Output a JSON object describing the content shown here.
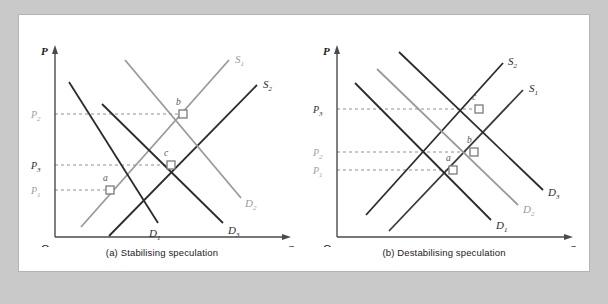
{
  "figure": {
    "background": "#ffffff",
    "outer_background": "#c9c9c9",
    "border_color": "#b4b4b4"
  },
  "colors": {
    "dark": "#2b2b2b",
    "gray": "#9a9a9a",
    "axis": "#4a4a4a",
    "dashed": "#8f8f8f",
    "point_fill": "#ffffff",
    "point_stroke": "#7a7a7a"
  },
  "panels": [
    {
      "id": "a",
      "caption": "(a)  Stabilising speculation",
      "axes": {
        "y_label": "P",
        "x_label": "Q",
        "origin_label": "O"
      },
      "price_levels": [
        {
          "label": "P",
          "sub": "2",
          "tone": "gray",
          "y": 99
        },
        {
          "label": "P",
          "sub": "3",
          "tone": "dark",
          "y": 150
        },
        {
          "label": "P",
          "sub": "1",
          "tone": "gray",
          "y": 175
        }
      ],
      "curves": [
        {
          "name": "S1",
          "label": "S",
          "sub": "1",
          "tone": "gray",
          "x1": 62,
          "y1": 212,
          "x2": 210,
          "y2": 45,
          "lx": 216,
          "ly": 48
        },
        {
          "name": "S2",
          "label": "S",
          "sub": "2",
          "tone": "dark",
          "x1": 90,
          "y1": 221,
          "x2": 238,
          "y2": 70,
          "lx": 244,
          "ly": 73
        },
        {
          "name": "D1",
          "label": "D",
          "sub": "1",
          "tone": "dark",
          "x1": 50,
          "y1": 67,
          "x2": 139,
          "y2": 208,
          "lx": 130,
          "ly": 218
        },
        {
          "name": "D2",
          "label": "D",
          "sub": "2",
          "tone": "gray",
          "x1": 106,
          "y1": 45,
          "x2": 222,
          "y2": 183,
          "lx": 225,
          "ly": 190
        },
        {
          "name": "D3",
          "label": "D",
          "sub": "3",
          "tone": "dark",
          "x1": 83,
          "y1": 89,
          "x2": 204,
          "y2": 208,
          "lx": 208,
          "ly": 216
        }
      ],
      "points": [
        {
          "label": "a",
          "x": 91,
          "y": 175,
          "lx": 86,
          "ly": 167
        },
        {
          "label": "b",
          "x": 164,
          "y": 99,
          "lx": 159,
          "ly": 91
        },
        {
          "label": "c",
          "x": 152,
          "y": 150,
          "lx": 147,
          "ly": 142
        }
      ]
    },
    {
      "id": "b",
      "caption": "(b)  Destabilising speculation",
      "axes": {
        "y_label": "P",
        "x_label": "Q",
        "origin_label": "O"
      },
      "price_levels": [
        {
          "label": "P",
          "sub": "3",
          "tone": "dark",
          "y": 94
        },
        {
          "label": "P",
          "sub": "2",
          "tone": "gray",
          "y": 137
        },
        {
          "label": "P",
          "sub": "1",
          "tone": "gray",
          "y": 155
        }
      ],
      "curves": [
        {
          "name": "S2",
          "label": "S",
          "sub": "2",
          "tone": "dark",
          "x1": 65,
          "y1": 200,
          "x2": 202,
          "y2": 48,
          "lx": 207,
          "ly": 50
        },
        {
          "name": "S1",
          "label": "S",
          "sub": "1",
          "tone": "dark",
          "x1": 88,
          "y1": 216,
          "x2": 222,
          "y2": 75,
          "lx": 227,
          "ly": 77
        },
        {
          "name": "D1",
          "label": "D",
          "sub": "1",
          "tone": "dark",
          "x1": 54,
          "y1": 68,
          "x2": 190,
          "y2": 205,
          "lx": 195,
          "ly": 212
        },
        {
          "name": "D2",
          "label": "D",
          "sub": "2",
          "tone": "gray",
          "x1": 76,
          "y1": 54,
          "x2": 217,
          "y2": 190,
          "lx": 222,
          "ly": 196
        },
        {
          "name": "D3",
          "label": "D",
          "sub": "3",
          "tone": "dark",
          "x1": 98,
          "y1": 37,
          "x2": 242,
          "y2": 175,
          "lx": 247,
          "ly": 180
        }
      ],
      "points": [
        {
          "label": "a",
          "x": 152,
          "y": 155,
          "lx": 147,
          "ly": 147
        },
        {
          "label": "b",
          "x": 173,
          "y": 137,
          "lx": 168,
          "ly": 129
        },
        {
          "label": "c",
          "x": 178,
          "y": 94,
          "lx": 173,
          "ly": 86
        }
      ]
    }
  ]
}
